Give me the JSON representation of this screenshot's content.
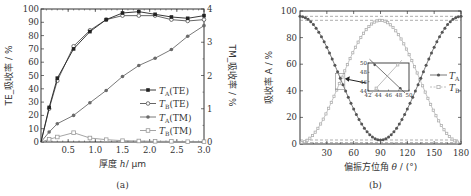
{
  "chart_data": [
    {
      "id": "a",
      "type": "line",
      "caption": "(a)",
      "xlabel": "厚度 h / μm",
      "ylabel_left": "TE_吸收率 / %",
      "ylabel_right": "TM_吸收率 / %",
      "xlim": [
        0,
        3.0
      ],
      "ylim_left": [
        0,
        100
      ],
      "ylim_right": [
        0,
        4
      ],
      "xticks": [
        "0.5",
        "1.0",
        "1.5",
        "2.0",
        "2.5",
        "3.0"
      ],
      "yticks_left": [
        "0",
        "10",
        "20",
        "30",
        "40",
        "50",
        "60",
        "70",
        "80",
        "90",
        "100"
      ],
      "yticks_right": [
        "0",
        "1",
        "2",
        "3",
        "4"
      ],
      "x": [
        0,
        0.15,
        0.3,
        0.6,
        0.9,
        1.2,
        1.5,
        1.8,
        2.1,
        2.4,
        2.7,
        3.0
      ],
      "series": [
        {
          "name": "T_A(TE)",
          "axis": "left",
          "marker": "filled-square",
          "values": [
            0,
            26,
            48,
            70,
            83,
            92,
            97,
            98,
            96,
            94,
            93,
            95
          ]
        },
        {
          "name": "T_B(TE)",
          "axis": "left",
          "marker": "open-circle",
          "values": [
            0,
            25,
            46,
            72,
            84,
            92,
            95,
            95,
            95,
            92,
            91,
            92
          ]
        },
        {
          "name": "T_A(TM)",
          "axis": "right",
          "marker": "filled-circle",
          "values": [
            0,
            0.3,
            0.55,
            0.8,
            1.18,
            1.55,
            1.97,
            2.3,
            2.52,
            2.78,
            3.18,
            3.5
          ]
        },
        {
          "name": "T_B(TM)",
          "axis": "right",
          "marker": "open-square",
          "values": [
            0,
            0.08,
            0.15,
            0.28,
            0.12,
            0.07,
            0.04,
            0.03,
            0.02,
            0.02,
            0.01,
            0.01
          ]
        }
      ],
      "legend": {
        "position": "lower right",
        "entries": [
          "T_A(TE)",
          "T_B(TE)",
          "T_A(TM)",
          "T_B(TM)"
        ]
      },
      "grid": false
    },
    {
      "id": "b",
      "type": "line",
      "caption": "(b)",
      "xlabel": "偏振方位角 θ / (°)",
      "ylabel": "吸收率 A / %",
      "xlim": [
        0,
        180
      ],
      "ylim": [
        0,
        100
      ],
      "xticks": [
        "30",
        "60",
        "90",
        "120",
        "150",
        "180"
      ],
      "yticks": [
        "0",
        "20",
        "40",
        "60",
        "80",
        "100"
      ],
      "series": [
        {
          "name": "T_A",
          "marker": "filled-circle",
          "formula": "A = 2 + 94*cos^2(theta)",
          "max": 96,
          "min": 3,
          "min_at": 90
        },
        {
          "name": "T_B",
          "marker": "open-square",
          "formula": "A = 1 + 92*sin^2(theta)",
          "max": 93,
          "min": 1,
          "max_at": 90
        }
      ],
      "reference_lines": [
        96,
        93,
        3,
        1
      ],
      "legend": {
        "position": "center right",
        "entries": [
          "T_A",
          "T_B"
        ]
      },
      "inset": {
        "xlim": [
          42,
          50
        ],
        "ylim": [
          44,
          50
        ],
        "xticks": [
          "42",
          "44",
          "46",
          "48",
          "50"
        ],
        "yticks": [
          "44",
          "46",
          "48",
          "50"
        ],
        "crossing_x": 45,
        "crossing_y": 47
      },
      "grid": false
    }
  ],
  "captions": {
    "a": "(a)",
    "b": "(b)"
  },
  "labels": {
    "a_xlabel_cn": "厚度",
    "a_xlabel_var": "h",
    "a_xlabel_unit": "/ μm",
    "a_ylabel_left": "TE_吸收率 / %",
    "a_ylabel_right": "TM_吸收率 / %",
    "b_xlabel_cn": "偏振方位角",
    "b_xlabel_var": "θ",
    "b_xlabel_unit": "/ (°)",
    "b_ylabel": "吸收率 A / %"
  },
  "legend_a": [
    {
      "sym": "T",
      "sub": "A",
      "suffix": "(TE)"
    },
    {
      "sym": "T",
      "sub": "B",
      "suffix": "(TE)"
    },
    {
      "sym": "T",
      "sub": "A",
      "suffix": "(TM)"
    },
    {
      "sym": "T",
      "sub": "B",
      "suffix": "(TM)"
    }
  ],
  "legend_b": [
    {
      "sym": "T",
      "sub": "A"
    },
    {
      "sym": "T",
      "sub": "B"
    }
  ],
  "colors": {
    "ta_te": "#222222",
    "tb_te": "#555555",
    "ta_tm": "#6a6a6a",
    "tb_tm": "#9a9a9a",
    "ta_b": "#555555",
    "tb_b": "#b0b0b0",
    "axis": "#333333"
  }
}
